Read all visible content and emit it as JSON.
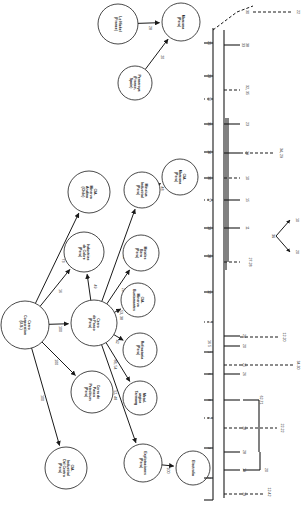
{
  "figure": {
    "kind": "ownership-network-diagram",
    "orientation_degrees": 90,
    "background_color": "#ffffff",
    "stroke_color": "#1a1a1a",
    "width": 308,
    "height": 512
  },
  "network": {
    "nodes": [
      {
        "id": "le_nickel",
        "label": "Le Nickel\n(France)",
        "cx": 118,
        "cy": 24,
        "r": 20
      },
      {
        "id": "penarroya",
        "label": "Penarroya\n(France,\nSpain)",
        "cx": 135,
        "cy": 83,
        "r": 17
      },
      {
        "id": "marcona",
        "label": "Marcona\n(Peru)",
        "cx": 181,
        "cy": 22,
        "r": 19
      },
      {
        "id": "cia_min_andina",
        "label": "CIA.\nMinerva\nAndina\n(Chile)",
        "cx": 89,
        "cy": 192,
        "r": 21
      },
      {
        "id": "industrias_cobre",
        "label": "Industrias\nde Cobre\n(Peru)",
        "cx": 84,
        "cy": 252,
        "r": 20
      },
      {
        "id": "minsiua_ind",
        "label": "Minsiua\nIndustrial\n(Peru)",
        "cx": 142,
        "cy": 190,
        "r": 18
      },
      {
        "id": "metales_bera",
        "label": "Metales\nBera\n(Peru)",
        "cx": 141,
        "cy": 253,
        "r": 18
      },
      {
        "id": "cia_marcona",
        "label": "CIA.\nMarcona\n(Peru)",
        "cx": 180,
        "cy": 177,
        "r": 18
      },
      {
        "id": "cia_min_bustam",
        "label": "CIA.\nMinerva\nBustamantes",
        "cx": 138,
        "cy": 300,
        "r": 17
      },
      {
        "id": "refractaria",
        "label": "Refractaria\n(Peru)",
        "cx": 140,
        "cy": 350,
        "r": 17
      },
      {
        "id": "metalurgica",
        "label": "Metal-\nurgica\nTarmang",
        "cx": 140,
        "cy": 398,
        "r": 17
      },
      {
        "id": "cerro_corp",
        "label": "Cerro\nCorporation\n(U.S.)",
        "cx": 25,
        "cy": 325,
        "r": 24
      },
      {
        "id": "cerro_pasco",
        "label": "Cerro\nde Pasco\n(Peru)",
        "cx": 94,
        "cy": 323,
        "r": 23
      },
      {
        "id": "cerro_pasco_pet",
        "label": "Cerro de\nPasco\nPetroleum\n(Peru)",
        "cx": 92,
        "cy": 392,
        "r": 21
      },
      {
        "id": "cia_ind_centro",
        "label": "CIA.\nIndustrial\nDel Centro\n(Peru)",
        "cx": 66,
        "cy": 468,
        "r": 21
      },
      {
        "id": "explotaciones",
        "label": "Explotaciones\n(Peru)",
        "cx": 143,
        "cy": 463,
        "r": 19
      },
      {
        "id": "electrolia",
        "label": "Electrolia",
        "cx": 193,
        "cy": 468,
        "r": 17
      }
    ],
    "edges": [
      {
        "from": "le_nickel",
        "to": "marcona",
        "label": "28"
      },
      {
        "from": "penarroya",
        "to": "marcona",
        "label": "20"
      },
      {
        "from": "cerro_corp",
        "to": "cia_min_andina",
        "label": "73"
      },
      {
        "from": "cerro_corp",
        "to": "industrias_cobre",
        "label": "16"
      },
      {
        "from": "cerro_corp",
        "to": "cerro_pasco",
        "label": "100"
      },
      {
        "from": "cerro_corp",
        "to": "cerro_pasco_pet",
        "label": "100"
      },
      {
        "from": "cerro_corp",
        "to": "cia_ind_centro",
        "label": "100"
      },
      {
        "from": "cerro_pasco",
        "to": "industrias_cobre",
        "label": "49"
      },
      {
        "from": "cerro_pasco",
        "to": "minsiua_ind",
        "label": "48"
      },
      {
        "from": "cerro_pasco",
        "to": "metales_bera",
        "label": "28"
      },
      {
        "from": "cerro_pasco",
        "to": "cia_min_bustam",
        "label": "53, 38"
      },
      {
        "from": "cerro_pasco",
        "to": "refractaria",
        "label": "42"
      },
      {
        "from": "cerro_pasco",
        "to": "metalurgica",
        "label": "88, 54"
      },
      {
        "from": "cerro_pasco",
        "to": "explotaciones",
        "label": "52, 48"
      },
      {
        "from": "minsiua_ind",
        "to": "cia_marcona",
        "label": "48"
      },
      {
        "from": "explotaciones",
        "to": "electrolia",
        "label": "100"
      }
    ]
  },
  "dendrogram": {
    "axis_label": "",
    "spine_x": 213,
    "leaves": [
      {
        "label": "22",
        "x": 297,
        "y": 12
      },
      {
        "label": "30",
        "x": 246,
        "y": 12
      },
      {
        "label": "21",
        "x": 208,
        "y": 43
      },
      {
        "label": "38\n33",
        "x": 246,
        "y": 45
      },
      {
        "label": "23",
        "x": 208,
        "y": 76
      },
      {
        "label": "32, 35",
        "x": 246,
        "y": 90
      },
      {
        "label": "36",
        "x": 208,
        "y": 99
      },
      {
        "label": "35",
        "x": 208,
        "y": 124
      },
      {
        "label": "23",
        "x": 246,
        "y": 124
      },
      {
        "label": "14",
        "x": 208,
        "y": 152
      },
      {
        "label": "34, 29",
        "x": 280,
        "y": 153
      },
      {
        "label": "29",
        "x": 246,
        "y": 153
      },
      {
        "label": "30",
        "x": 208,
        "y": 178
      },
      {
        "label": "10",
        "x": 246,
        "y": 178
      },
      {
        "label": "17",
        "x": 208,
        "y": 200
      },
      {
        "label": "15",
        "x": 246,
        "y": 200
      },
      {
        "label": "13",
        "x": 208,
        "y": 228
      },
      {
        "label": "11",
        "x": 246,
        "y": 228
      },
      {
        "label": "28",
        "x": 208,
        "y": 256
      },
      {
        "label": "27-28",
        "x": 249,
        "y": 262
      },
      {
        "label": "12",
        "x": 208,
        "y": 292
      },
      {
        "label": "7",
        "x": 208,
        "y": 322
      },
      {
        "label": "24",
        "x": 243,
        "y": 336
      },
      {
        "label": "12-20",
        "x": 283,
        "y": 337
      },
      {
        "label": "5",
        "x": 208,
        "y": 346
      },
      {
        "label": "20",
        "x": 243,
        "y": 346
      },
      {
        "label": "6",
        "x": 208,
        "y": 374
      },
      {
        "label": "26",
        "x": 243,
        "y": 374
      },
      {
        "label": "16",
        "x": 208,
        "y": 342
      },
      {
        "label": "1",
        "x": 208,
        "y": 352
      },
      {
        "label": "34-30",
        "x": 297,
        "y": 365
      },
      {
        "label": "25",
        "x": 243,
        "y": 365
      },
      {
        "label": "62-71",
        "x": 260,
        "y": 400
      },
      {
        "label": "18",
        "x": 243,
        "y": 428
      },
      {
        "label": "22-22",
        "x": 281,
        "y": 428
      },
      {
        "label": "28",
        "x": 243,
        "y": 452
      },
      {
        "label": "20",
        "x": 265,
        "y": 470
      },
      {
        "label": "19",
        "x": 243,
        "y": 470
      },
      {
        "label": "12-42",
        "x": 268,
        "y": 492
      },
      {
        "label": "19",
        "x": 243,
        "y": 494
      },
      {
        "label": "4",
        "x": 208,
        "y": 418
      },
      {
        "label": "3",
        "x": 208,
        "y": 448
      },
      {
        "label": "2",
        "x": 208,
        "y": 478
      },
      {
        "label": "8",
        "x": 208,
        "y": 400
      }
    ]
  },
  "small_cluster": {
    "center_label": "36",
    "branch_labels": [
      "10",
      "20"
    ],
    "cx": 272,
    "cy": 236
  }
}
